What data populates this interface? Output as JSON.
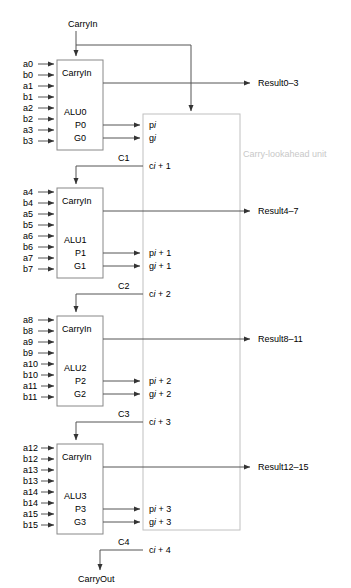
{
  "figure": {
    "unit_label": "Carry-lookahead unit",
    "top_input": "CarryIn",
    "bottom_output": "CarryOut"
  },
  "colors": {
    "wire": "#555555",
    "box_border": "#888888",
    "lookahead_border": "#c0c0c0",
    "unit_label": "#c8c8c8",
    "text": "#000000",
    "background": "#ffffff"
  },
  "alus": [
    {
      "name": "ALU0",
      "carryin_label": "CarryIn",
      "p_port": "P0",
      "g_port": "G0",
      "carry_out_label": "C1",
      "result_label": "Result0–3",
      "inputs": [
        "a0",
        "b0",
        "a1",
        "b1",
        "a2",
        "b2",
        "a3",
        "b3"
      ],
      "lookahead_signals": {
        "p": "p",
        "p_sub": "i",
        "g": "g",
        "g_sub": "i",
        "c": "c",
        "c_sub": "i",
        "c_suffix": "+ 1"
      }
    },
    {
      "name": "ALU1",
      "carryin_label": "CarryIn",
      "p_port": "P1",
      "g_port": "G1",
      "carry_out_label": "C2",
      "result_label": "Result4–7",
      "inputs": [
        "a4",
        "b4",
        "a5",
        "b5",
        "a6",
        "b6",
        "a7",
        "b7"
      ],
      "lookahead_signals": {
        "p": "p",
        "p_sub": "i",
        "p_suffix": "+ 1",
        "g": "g",
        "g_sub": "i",
        "g_suffix": "+ 1",
        "c": "c",
        "c_sub": "i",
        "c_suffix": "+ 2"
      }
    },
    {
      "name": "ALU2",
      "carryin_label": "CarryIn",
      "p_port": "P2",
      "g_port": "G2",
      "carry_out_label": "C3",
      "result_label": "Result8–11",
      "inputs": [
        "a8",
        "b8",
        "a9",
        "b9",
        "a10",
        "b10",
        "a11",
        "b11"
      ],
      "lookahead_signals": {
        "p": "p",
        "p_sub": "i",
        "p_suffix": "+ 2",
        "g": "g",
        "g_sub": "i",
        "g_suffix": "+ 2",
        "c": "c",
        "c_sub": "i",
        "c_suffix": "+ 3"
      }
    },
    {
      "name": "ALU3",
      "carryin_label": "CarryIn",
      "p_port": "P3",
      "g_port": "G3",
      "carry_out_label": "C4",
      "result_label": "Result12–15",
      "inputs": [
        "a12",
        "b12",
        "a13",
        "b13",
        "a14",
        "b14",
        "a15",
        "b15"
      ],
      "lookahead_signals": {
        "p": "p",
        "p_sub": "i",
        "p_suffix": "+ 3",
        "g": "g",
        "g_sub": "i",
        "g_suffix": "+ 3",
        "c": "c",
        "c_sub": "i",
        "c_suffix": "+ 4"
      }
    }
  ]
}
